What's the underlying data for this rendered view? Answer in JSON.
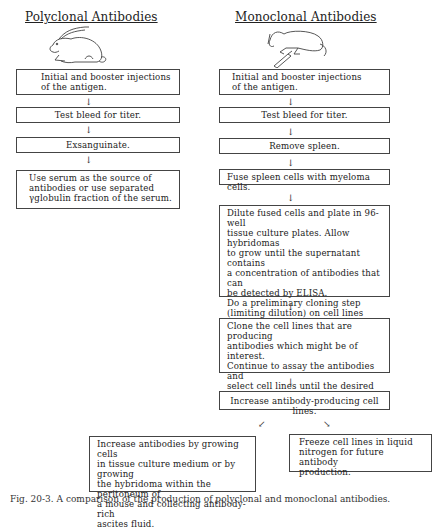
{
  "polyclonal": {
    "title": "Polyclonal Antibodies",
    "icon": "rabbit-icon",
    "steps": [
      "Initial and booster injections\nof the antigen.",
      "Test bleed for titer.",
      "Exsanguinate.",
      "Use serum as the source of\nantibodies or use separated\nγglobulin fraction of the serum."
    ]
  },
  "monoclonal": {
    "title": "Monoclonal Antibodies",
    "icon": "mouse-with-syringe-icon",
    "steps": [
      "Initial and booster injections\nof the antigen.",
      "Test bleed for titer.",
      "Remove spleen.",
      "Fuse spleen cells with myeloma cells.",
      "Dilute fused cells and plate in 96-well\ntissue culture plates.  Allow hybridomas\nto grow until the supernatant contains\na concentration of antibodies that can\nbe detected by ELISA.\nDo a preliminary cloning step\n(limiting dilution) on cell lines\nof possible interest and assay for\nspecificity or cross-reactivity.",
      "Clone the cell lines that are producing\nantibodies which might be of interest.\nContinue to assay the antibodies and\nselect cell lines until the desired mono-\nclonal antibodies are obtained.",
      "Increase antibody-producing cell lines."
    ],
    "branches": [
      "Increase antibodies by growing cells\nin tissue culture medium or by growing\nthe hybridoma within the peritoneum of\na mouse and collecting antibody-rich\nascites fluid.",
      "Freeze cell lines in liquid\nnitrogen for future antibody\nproduction."
    ]
  },
  "arrows": {
    "down": "↓",
    "down_left": "↙",
    "down_right": "↘"
  },
  "caption": "Fig. 20-3.  A comparison of the production of polyclonal and monoclonal antibodies."
}
